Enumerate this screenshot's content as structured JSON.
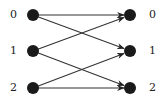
{
  "diagram": {
    "type": "bipartite-directed-graph",
    "left_nodes": [
      {
        "id": "L0",
        "label": "0"
      },
      {
        "id": "L1",
        "label": "1"
      },
      {
        "id": "L2",
        "label": "2"
      }
    ],
    "right_nodes": [
      {
        "id": "R0",
        "label": "0"
      },
      {
        "id": "R1",
        "label": "1"
      },
      {
        "id": "R2",
        "label": "2"
      }
    ],
    "edges": [
      {
        "from": "L0",
        "to": "R0"
      },
      {
        "from": "L0",
        "to": "R1"
      },
      {
        "from": "L1",
        "to": "R0"
      },
      {
        "from": "L1",
        "to": "R2"
      },
      {
        "from": "L2",
        "to": "R1"
      },
      {
        "from": "L2",
        "to": "R2"
      }
    ],
    "colors": {
      "node": "#1a1a1a",
      "edge": "#333333",
      "label": "#222222"
    }
  }
}
